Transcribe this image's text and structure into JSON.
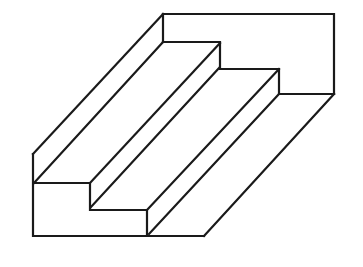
{
  "figure": {
    "title": "",
    "stroke_color": "#1a1a1a",
    "background": "#ffffff"
  }
}
